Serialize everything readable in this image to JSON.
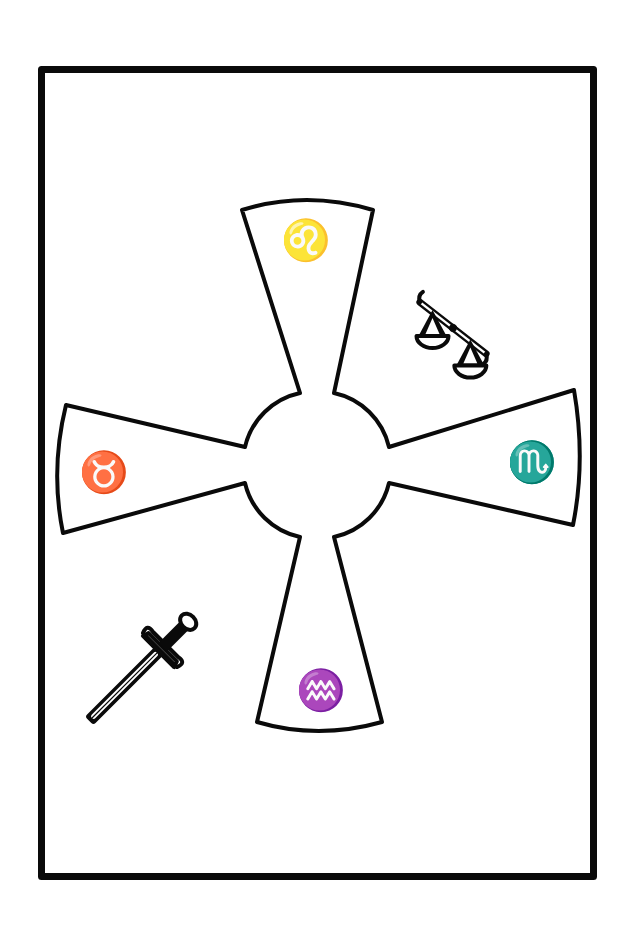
{
  "figure": {
    "frame": {
      "stroke_color": "#0a0a0a",
      "background": "#ffffff"
    },
    "cross": {
      "arms": [
        {
          "position": "top",
          "symbol": "♌",
          "symbol_name": "Leo"
        },
        {
          "position": "right",
          "symbol": "♏",
          "symbol_name": "Scorpio"
        },
        {
          "position": "bottom",
          "symbol": "♒",
          "symbol_name": "Aquarius"
        },
        {
          "position": "left",
          "symbol": "♉",
          "symbol_name": "Taurus"
        }
      ],
      "center": "circle"
    },
    "emblems": [
      {
        "name": "scales",
        "position": "upper-right",
        "meaning": "Libra / balance"
      },
      {
        "name": "sword",
        "position": "lower-left"
      }
    ]
  }
}
